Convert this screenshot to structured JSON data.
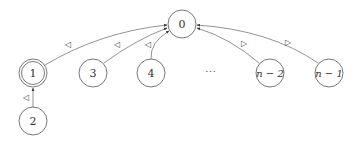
{
  "diagram": {
    "type": "state-graph",
    "nodes": [
      {
        "id": "0",
        "label": "0",
        "accepting": false
      },
      {
        "id": "1",
        "label": "1",
        "accepting": true
      },
      {
        "id": "2",
        "label": "2",
        "accepting": false
      },
      {
        "id": "3",
        "label": "3",
        "accepting": false
      },
      {
        "id": "4",
        "label": "4",
        "accepting": false
      },
      {
        "id": "n-2",
        "label": "n − 2",
        "accepting": false
      },
      {
        "id": "n-1",
        "label": "n − 1",
        "accepting": false
      }
    ],
    "ellipsis": "⋯",
    "edges": [
      {
        "from": "1",
        "to": "0",
        "label": "◁"
      },
      {
        "from": "3",
        "to": "0",
        "label": "◁"
      },
      {
        "from": "4",
        "to": "0",
        "label": "◁"
      },
      {
        "from": "2",
        "to": "1",
        "label": "◁"
      },
      {
        "from": "n-2",
        "to": "0",
        "label": "▷"
      },
      {
        "from": "n-1",
        "to": "0",
        "label": "▷"
      }
    ]
  }
}
